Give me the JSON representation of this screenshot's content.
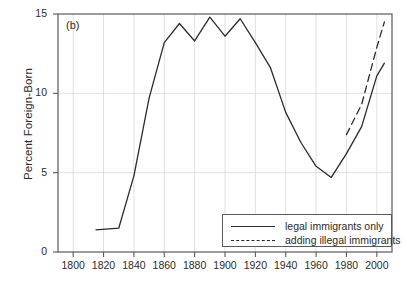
{
  "figure": {
    "panel_label": "(b)",
    "ylabel": "Percent Foreign-Born"
  },
  "legend": {
    "items": [
      {
        "label": "legal immigrants only",
        "style": "solid",
        "color": "#2b2b2b"
      },
      {
        "label": "adding illegal immigrants",
        "style": "dashed",
        "color": "#2b2b2b"
      }
    ]
  },
  "chart_data": {
    "type": "line",
    "title": "",
    "subtitle": "",
    "xlabel": "",
    "ylabel": "Percent Foreign-Born",
    "annotation": "(b)",
    "xlim": [
      1790,
      2010
    ],
    "ylim": [
      0,
      15
    ],
    "xticks": [
      1800,
      1820,
      1840,
      1860,
      1880,
      1900,
      1920,
      1940,
      1960,
      1980,
      2000
    ],
    "yticks": [
      0,
      5,
      10,
      15
    ],
    "xtick_labels": [
      "1800",
      "1820",
      "1840",
      "1860",
      "1880",
      "1900",
      "1920",
      "1940",
      "1960",
      "1980",
      "2000"
    ],
    "ytick_labels": [
      "0",
      "5",
      "10",
      "15"
    ],
    "grid": true,
    "legend_position": "lower right",
    "series": [
      {
        "name": "legal immigrants only",
        "style": "solid",
        "color": "#2b2b2b",
        "x": [
          1815,
          1830,
          1840,
          1850,
          1860,
          1870,
          1880,
          1890,
          1900,
          1910,
          1920,
          1930,
          1940,
          1950,
          1960,
          1970,
          1980,
          1990,
          2000,
          2005
        ],
        "y": [
          1.4,
          1.5,
          4.8,
          9.7,
          13.2,
          14.4,
          13.3,
          14.8,
          13.6,
          14.7,
          13.2,
          11.6,
          8.8,
          6.9,
          5.4,
          4.7,
          6.2,
          7.9,
          11.1,
          11.9
        ]
      },
      {
        "name": "adding illegal immigrants",
        "style": "dashed",
        "color": "#2b2b2b",
        "x": [
          1980,
          1990,
          2000,
          2005
        ],
        "y": [
          7.4,
          9.3,
          12.9,
          14.5
        ]
      }
    ]
  }
}
